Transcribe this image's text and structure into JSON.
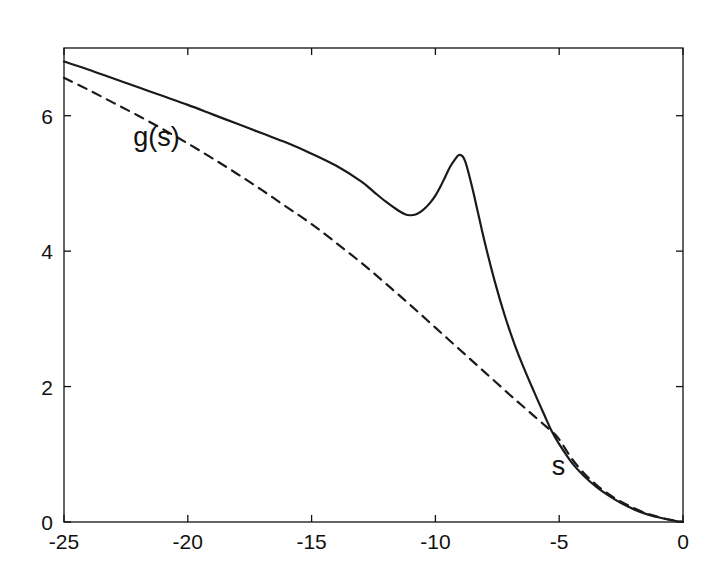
{
  "figure": {
    "background_color": "#ffffff",
    "foreground_color": "#111111",
    "annotations": {
      "y_axis_label": "g(s)",
      "x_axis_label": "s"
    }
  },
  "chart_data": {
    "type": "line",
    "title": "",
    "xlabel": "s",
    "ylabel": "g(s)",
    "xlim": [
      -25,
      0
    ],
    "ylim": [
      0,
      7.0
    ],
    "xticks": [
      -25,
      -20,
      -15,
      -10,
      -5,
      0
    ],
    "xtick_labels": [
      "-25",
      "-20",
      "-15",
      "-10",
      "-5",
      "0"
    ],
    "yticks": [
      0,
      2,
      4,
      6
    ],
    "ytick_labels": [
      "0",
      "2",
      "4",
      "6"
    ],
    "grid": false,
    "legend": null,
    "annotations": [
      {
        "text": "g(s)",
        "x": -22.2,
        "y": 5.55
      },
      {
        "text": "s",
        "x": -5.3,
        "y": 0.7
      }
    ],
    "series": [
      {
        "name": "solid-curve",
        "style": "solid",
        "color": "#1a1a1a",
        "linewidth": 2.2,
        "x": [
          -25,
          -24,
          -23,
          -22,
          -21,
          -20,
          -19,
          -18,
          -17,
          -16,
          -15,
          -14,
          -13,
          -12.5,
          -12,
          -11.5,
          -11.2,
          -11,
          -10.8,
          -10.6,
          -10.4,
          -10.2,
          -10,
          -9.8,
          -9.6,
          -9.4,
          -9.2,
          -9.05,
          -8.9,
          -8.8,
          -8.7,
          -8.5,
          -8.3,
          -8,
          -7.6,
          -7.2,
          -6.8,
          -6.4,
          -6,
          -5.6,
          -5.3,
          -5,
          -4.5,
          -4,
          -3.5,
          -3,
          -2.5,
          -2,
          -1.5,
          -1,
          -0.5,
          0
        ],
        "y": [
          6.8,
          6.68,
          6.55,
          6.42,
          6.29,
          6.16,
          6.02,
          5.88,
          5.74,
          5.6,
          5.44,
          5.26,
          5.03,
          4.88,
          4.73,
          4.6,
          4.54,
          4.53,
          4.54,
          4.58,
          4.64,
          4.72,
          4.82,
          4.95,
          5.1,
          5.25,
          5.36,
          5.42,
          5.4,
          5.33,
          5.21,
          4.92,
          4.6,
          4.12,
          3.55,
          3.05,
          2.62,
          2.25,
          1.91,
          1.58,
          1.34,
          1.15,
          0.88,
          0.68,
          0.52,
          0.39,
          0.28,
          0.19,
          0.12,
          0.07,
          0.03,
          0.0
        ]
      },
      {
        "name": "dashed-curve",
        "style": "dashed",
        "color": "#1a1a1a",
        "linewidth": 2.2,
        "dash_pattern": "9,7",
        "x": [
          -25,
          -24,
          -23,
          -22,
          -21,
          -20,
          -19,
          -18,
          -17,
          -16,
          -15,
          -14,
          -13,
          -12,
          -11,
          -10,
          -9,
          -8,
          -7,
          -6.5,
          -6,
          -5.5,
          -5.3,
          -5,
          -4.5,
          -4,
          -3.5,
          -3,
          -2.5,
          -2,
          -1.5,
          -1,
          -0.5,
          0
        ],
        "y": [
          6.56,
          6.38,
          6.19,
          6.0,
          5.8,
          5.59,
          5.37,
          5.14,
          4.9,
          4.65,
          4.4,
          4.12,
          3.83,
          3.52,
          3.2,
          2.87,
          2.54,
          2.21,
          1.88,
          1.72,
          1.56,
          1.4,
          1.34,
          1.22,
          0.94,
          0.72,
          0.55,
          0.41,
          0.3,
          0.21,
          0.13,
          0.075,
          0.032,
          0.0
        ]
      }
    ]
  }
}
